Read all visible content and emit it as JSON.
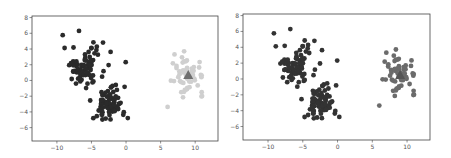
{
  "chart_data": [
    {
      "type": "scatter",
      "title": "",
      "xlabel": "",
      "ylabel": "",
      "xlim": [
        -13.6,
        13.3
      ],
      "ylim": [
        -7.7,
        8.2
      ],
      "xticks": [
        -10,
        -5,
        0,
        5,
        10
      ],
      "yticks": [
        -6,
        -4,
        -2,
        0,
        2,
        4,
        6,
        8
      ],
      "grid": false,
      "legend": null,
      "frame": {
        "left": 32,
        "top": 16,
        "right": 218,
        "bottom": 141
      },
      "series": [
        {
          "name": "cluster-upper-left",
          "color": "#2b2b2b",
          "marker": "circle",
          "center": [
            -6,
            1.8
          ],
          "spread": [
            1.8,
            1.6
          ],
          "count": 80
        },
        {
          "name": "cluster-lower-middle",
          "color": "#2b2b2b",
          "marker": "circle",
          "center": [
            -2.5,
            -3
          ],
          "spread": [
            1.4,
            1.4
          ],
          "count": 80
        },
        {
          "name": "cluster-right",
          "color": "#cfcfcf",
          "marker": "circle",
          "center": [
            9,
            0.8
          ],
          "spread": [
            1.3,
            1.4
          ],
          "count": 60
        },
        {
          "name": "centroid",
          "color": "#6e6e6e",
          "marker": "triangle",
          "points": [
            [
              9,
              0.7
            ]
          ]
        }
      ]
    },
    {
      "type": "scatter",
      "title": "",
      "xlabel": "",
      "ylabel": "",
      "xlim": [
        -13.6,
        13.3
      ],
      "ylim": [
        -7.7,
        8.2
      ],
      "xticks": [
        -10,
        -5,
        0,
        5,
        10
      ],
      "yticks": [
        -6,
        -4,
        -2,
        0,
        2,
        4,
        6,
        8
      ],
      "grid": false,
      "legend": null,
      "frame": {
        "left": 243,
        "top": 14,
        "right": 430,
        "bottom": 140
      },
      "series": [
        {
          "name": "cluster-upper-left",
          "color": "#333333",
          "marker": "circle",
          "center": [
            -6,
            1.8
          ],
          "spread": [
            1.8,
            1.6
          ],
          "count": 80
        },
        {
          "name": "cluster-lower-middle",
          "color": "#333333",
          "marker": "circle",
          "center": [
            -2.5,
            -3
          ],
          "spread": [
            1.4,
            1.4
          ],
          "count": 80
        },
        {
          "name": "cluster-right",
          "color": "#6b6b6b",
          "marker": "circle",
          "center": [
            9,
            0.8
          ],
          "spread": [
            1.3,
            1.4
          ],
          "count": 60
        },
        {
          "name": "centroid",
          "color": "#555555",
          "marker": "triangle",
          "points": [
            [
              9,
              0.5
            ]
          ]
        }
      ]
    }
  ]
}
